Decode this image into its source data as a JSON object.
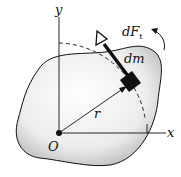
{
  "labels": {
    "y_axis": "y",
    "x_axis": "x",
    "origin": "O",
    "radius": "r",
    "mass_element": "dm",
    "force_main": "dF",
    "force_sub": "t"
  },
  "colors": {
    "ink": "#111111",
    "body_fill": "#e6e6e6",
    "background": "#ffffff"
  }
}
